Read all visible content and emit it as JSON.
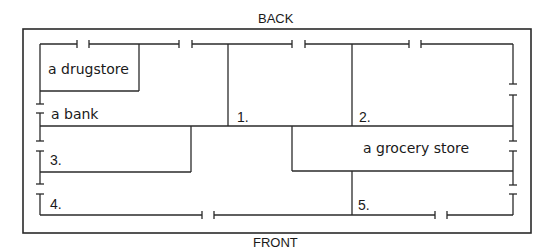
{
  "diagram": {
    "type": "floor-plan",
    "top_label": "BACK",
    "bottom_label": "FRONT",
    "rooms": [
      {
        "id": "drugstore",
        "label": "a drugstore"
      },
      {
        "id": "bank",
        "label": "a bank"
      },
      {
        "id": "space-1",
        "label": "1."
      },
      {
        "id": "space-2",
        "label": "2."
      },
      {
        "id": "space-3",
        "label": "3."
      },
      {
        "id": "grocery",
        "label": "a grocery store"
      },
      {
        "id": "space-4",
        "label": "4."
      },
      {
        "id": "space-5",
        "label": "5."
      }
    ],
    "colors": {
      "line": "#2a2a2a",
      "background": "#ffffff"
    }
  }
}
